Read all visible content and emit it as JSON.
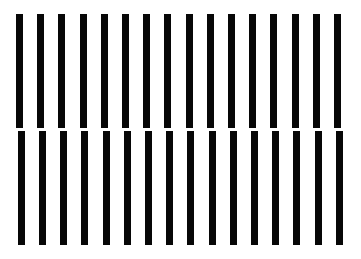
{
  "figure": {
    "type": "line-figure",
    "canvas_width": 361,
    "canvas_height": 259,
    "background_color": "#ffffff",
    "bar_color": "#070707"
  },
  "chart_data": {
    "type": "bar",
    "subtitle": "",
    "xlabel": "",
    "ylabel": "",
    "grid": false,
    "legend": false,
    "axis_visible": false,
    "tick_labels": [],
    "annotations": [],
    "background_color": "#ffffff",
    "bar_color": "#070707",
    "bar_count": 16,
    "bar_width_px": 7,
    "bar_pitch_px": 21.2,
    "first_bar_left_px": 16,
    "top_y_px": 14,
    "bottom_y_px": 245,
    "break_top_y_px": 128,
    "break_bottom_y_px": 131,
    "lower_segment_offset_px": 1.8,
    "categories": [
      "bar-1",
      "bar-2",
      "bar-3",
      "bar-4",
      "bar-5",
      "bar-6",
      "bar-7",
      "bar-8",
      "bar-9",
      "bar-10",
      "bar-11",
      "bar-12",
      "bar-13",
      "bar-14",
      "bar-15",
      "bar-16"
    ],
    "bars": [
      {
        "index": 1,
        "upper_x": 16.0,
        "lower_x": 17.8,
        "upper_top": 14,
        "upper_bottom": 128,
        "lower_top": 131,
        "lower_bottom": 245
      },
      {
        "index": 2,
        "upper_x": 37.2,
        "lower_x": 39.0,
        "upper_top": 14,
        "upper_bottom": 128,
        "lower_top": 131,
        "lower_bottom": 245
      },
      {
        "index": 3,
        "upper_x": 58.4,
        "lower_x": 60.2,
        "upper_top": 14,
        "upper_bottom": 128,
        "lower_top": 131,
        "lower_bottom": 245
      },
      {
        "index": 4,
        "upper_x": 79.6,
        "lower_x": 81.4,
        "upper_top": 14,
        "upper_bottom": 128,
        "lower_top": 131,
        "lower_bottom": 245
      },
      {
        "index": 5,
        "upper_x": 100.8,
        "lower_x": 102.6,
        "upper_top": 14,
        "upper_bottom": 128,
        "lower_top": 131,
        "lower_bottom": 245
      },
      {
        "index": 6,
        "upper_x": 122.0,
        "lower_x": 123.8,
        "upper_top": 14,
        "upper_bottom": 128,
        "lower_top": 131,
        "lower_bottom": 245
      },
      {
        "index": 7,
        "upper_x": 143.2,
        "lower_x": 145.0,
        "upper_top": 14,
        "upper_bottom": 128,
        "lower_top": 131,
        "lower_bottom": 245
      },
      {
        "index": 8,
        "upper_x": 164.4,
        "lower_x": 166.2,
        "upper_top": 14,
        "upper_bottom": 128,
        "lower_top": 131,
        "lower_bottom": 245
      },
      {
        "index": 9,
        "upper_x": 185.6,
        "lower_x": 187.4,
        "upper_top": 14,
        "upper_bottom": 128,
        "lower_top": 131,
        "lower_bottom": 245
      },
      {
        "index": 10,
        "upper_x": 206.8,
        "lower_x": 208.6,
        "upper_top": 14,
        "upper_bottom": 128,
        "lower_top": 131,
        "lower_bottom": 245
      },
      {
        "index": 11,
        "upper_x": 228.0,
        "lower_x": 229.8,
        "upper_top": 14,
        "upper_bottom": 128,
        "lower_top": 131,
        "lower_bottom": 245
      },
      {
        "index": 12,
        "upper_x": 249.2,
        "lower_x": 251.0,
        "upper_top": 14,
        "upper_bottom": 128,
        "lower_top": 131,
        "lower_bottom": 245
      },
      {
        "index": 13,
        "upper_x": 270.4,
        "lower_x": 272.2,
        "upper_top": 14,
        "upper_bottom": 128,
        "lower_top": 131,
        "lower_bottom": 245
      },
      {
        "index": 14,
        "upper_x": 291.6,
        "lower_x": 293.4,
        "upper_top": 14,
        "upper_bottom": 128,
        "lower_top": 131,
        "lower_bottom": 245
      },
      {
        "index": 15,
        "upper_x": 312.8,
        "lower_x": 314.6,
        "upper_top": 14,
        "upper_bottom": 128,
        "lower_top": 131,
        "lower_bottom": 245
      },
      {
        "index": 16,
        "upper_x": 334.0,
        "lower_x": 335.8,
        "upper_top": 14,
        "upper_bottom": 128,
        "lower_top": 131,
        "lower_bottom": 245
      }
    ],
    "values": [
      231,
      231,
      231,
      231,
      231,
      231,
      231,
      231,
      231,
      231,
      231,
      231,
      231,
      231,
      231,
      231
    ]
  }
}
